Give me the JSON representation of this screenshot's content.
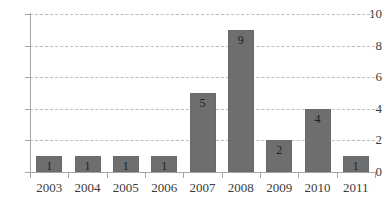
{
  "chart_data": {
    "type": "bar",
    "title": "",
    "subtitle": "",
    "xlabel": "",
    "ylabel": "",
    "categories": [
      "2003",
      "2004",
      "2005",
      "2006",
      "2007",
      "2008",
      "2009",
      "2010",
      "2011"
    ],
    "values": [
      1,
      1,
      1,
      1,
      5,
      9,
      2,
      4,
      1
    ],
    "data_labels": [
      "1",
      "1",
      "1",
      "1",
      "5",
      "9",
      "2",
      "4",
      "1"
    ],
    "ylim": [
      0,
      10
    ],
    "y_ticks": [
      0,
      2,
      4,
      6,
      8,
      10
    ],
    "y_tick_labels": [
      "0",
      "2",
      "4",
      "6",
      "8",
      "10"
    ],
    "grid": "horizontal-dashed",
    "legend": "none",
    "bar_color": "#6e6e6e",
    "grid_color": "#bdbdbd",
    "axis_color": "#a6a6a6",
    "text_color": "#3b3b3b",
    "background_color": "#ffffff"
  }
}
